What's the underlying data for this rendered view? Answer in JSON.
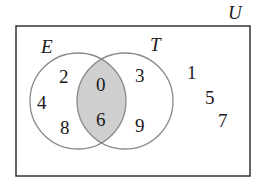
{
  "diagram": {
    "type": "venn",
    "universe_label": "U",
    "sets": [
      {
        "name": "E",
        "only": [
          "2",
          "4",
          "8"
        ]
      },
      {
        "name": "T",
        "only": [
          "3",
          "9"
        ]
      }
    ],
    "intersection": [
      "0",
      "6"
    ],
    "outside": [
      "1",
      "5",
      "7"
    ],
    "colors": {
      "stroke_box": "#333333",
      "stroke_circle": "#8a8a8a",
      "intersection_fill": "#cfcfcf"
    }
  }
}
